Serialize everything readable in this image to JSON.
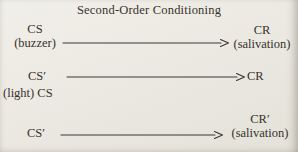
{
  "title": "Second-Order Conditioning",
  "diagram": {
    "row1": {
      "left_term": "CS",
      "left_sub": "(buzzer)",
      "right_term": "CR",
      "right_sub": "(salivation)"
    },
    "row2": {
      "left_term": "CS′",
      "left_sub": "(light) CS",
      "right_term": "CR"
    },
    "row3": {
      "left_term": "CS′",
      "right_term": "CR′",
      "right_sub": "(salivation)"
    }
  },
  "colors": {
    "background": "#ebe8e1",
    "text": "#35322c",
    "arrow": "#3a3732"
  }
}
